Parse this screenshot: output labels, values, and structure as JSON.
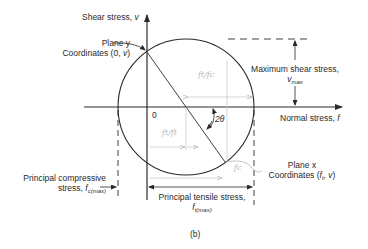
{
  "figure": {
    "caption": "(b)",
    "colors": {
      "ink": "#2a2a2a",
      "pencil": "#b8b8b8",
      "background": "#ffffff"
    },
    "axes": {
      "vertical_label_text": "Shear stress,",
      "vertical_label_symbol": "v",
      "horizontal_label_text": "Normal stress,",
      "horizontal_label_symbol": "f",
      "origin_label": "0"
    },
    "plane_y": {
      "line1": "Plane y",
      "line2_prefix": "Coordinates (0,",
      "line2_symbol": "v",
      "line2_suffix": ")"
    },
    "plane_x": {
      "line1": "Plane x",
      "line2_prefix": "Coordinates (",
      "line2_symbol": "f",
      "line2_sub": "t",
      "line2_mid": ",",
      "line2_symbol2": "v",
      "line2_suffix": ")"
    },
    "max_shear": {
      "line1": "Maximum shear stress,",
      "symbol": "v",
      "sub": "max"
    },
    "principal_compressive": {
      "line1": "Principal compressive",
      "line2": "stress,",
      "symbol": "f",
      "sub": "c(max)"
    },
    "principal_tensile": {
      "line1": "Principal tensile stress,",
      "symbol": "f",
      "sub": "t(max)"
    },
    "angle_label": "2θ",
    "handwritten_notes": {
      "upper": "ft/fc",
      "middle": "ft/ft",
      "lower": "fc"
    }
  }
}
